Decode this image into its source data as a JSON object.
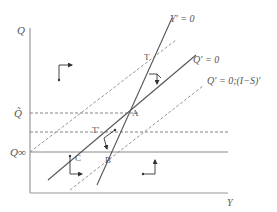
{
  "axes": {
    "y_label": "Q",
    "x_label": "Y",
    "q_tilde_label": "Q̃",
    "q_inf_label": "Q∞"
  },
  "curves": {
    "y_prime": "Y′ = 0",
    "q_prime": "Q′ = 0",
    "q_prime_shifted": "Q′ = 0;(I−S)′"
  },
  "points": {
    "A": "A",
    "B": "B",
    "C": "C",
    "T": "T",
    "T_prime": "T′"
  },
  "colors": {
    "line": "#555555",
    "axis": "#999999",
    "dashed": "#888888",
    "text": "#555555"
  }
}
